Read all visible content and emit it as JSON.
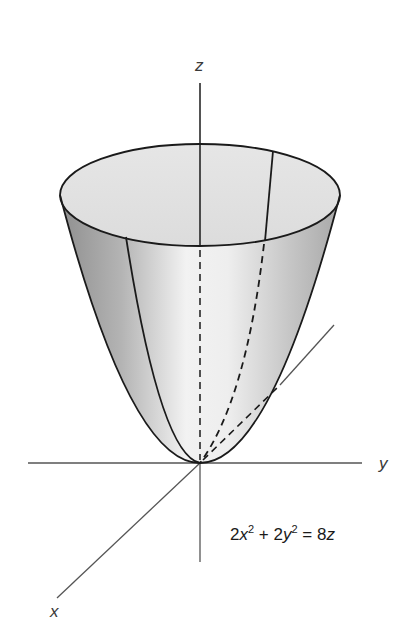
{
  "figure": {
    "kind": "3D surface plot (elliptic paraboloid)",
    "axes": {
      "z_label": "z",
      "y_label": "y",
      "x_label": "x"
    },
    "equation": {
      "coef_x": "2",
      "var_x": "x",
      "exp_x": "2",
      "plus": "+",
      "coef_y": "2",
      "var_y": "y",
      "exp_y": "2",
      "equals": "=",
      "coef_z": "8",
      "var_z": "z",
      "text": "2x^2 + 2y^2 = 8z"
    },
    "colors": {
      "surface_dark": "#9a9a9a",
      "surface_light": "#f4f4f4",
      "top_cap": "#e2e2e2",
      "outline": "#1a1a1a",
      "axis": "#555555"
    }
  }
}
